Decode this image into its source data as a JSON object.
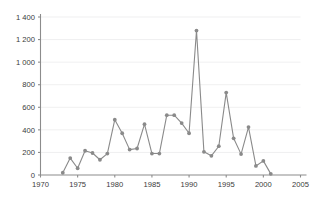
{
  "chart_data": {
    "type": "line",
    "title": "",
    "subtitle": "",
    "xlabel": "",
    "ylabel": "",
    "xlim": [
      1970,
      2005
    ],
    "ylim": [
      0,
      1400
    ],
    "grid": true,
    "legend": false,
    "legend_position": "none",
    "marker": "circle",
    "series_color": "#8a8a8a",
    "gridline_color": "#e8e8ea",
    "axis_color": "#8c8c8c",
    "x_tick_labels": [
      "1970",
      "1975",
      "1980",
      "1985",
      "1990",
      "1995",
      "2000",
      "2005"
    ],
    "x_ticks": [
      1970,
      1975,
      1980,
      1985,
      1990,
      1995,
      2000,
      2005
    ],
    "y_tick_labels": [
      "0",
      "200",
      "400",
      "600",
      "800",
      "1 000",
      "1 200",
      "1 400"
    ],
    "y_ticks": [
      0,
      200,
      400,
      600,
      800,
      1000,
      1200,
      1400
    ],
    "x": [
      1973,
      1974,
      1975,
      1976,
      1977,
      1978,
      1979,
      1980,
      1981,
      1982,
      1983,
      1984,
      1985,
      1986,
      1987,
      1988,
      1989,
      1990,
      1991,
      1992,
      1993,
      1994,
      1995,
      1996,
      1997,
      1998,
      1999,
      2000,
      2001
    ],
    "values": [
      20,
      150,
      60,
      215,
      195,
      135,
      190,
      490,
      370,
      225,
      235,
      450,
      190,
      190,
      530,
      530,
      460,
      370,
      1280,
      205,
      170,
      255,
      730,
      325,
      185,
      425,
      80,
      125,
      10
    ],
    "series": [
      {
        "name": "",
        "x": [
          1973,
          1974,
          1975,
          1976,
          1977,
          1978,
          1979,
          1980,
          1981,
          1982,
          1983,
          1984,
          1985,
          1986,
          1987,
          1988,
          1989,
          1990,
          1991,
          1992,
          1993,
          1994,
          1995,
          1996,
          1997,
          1998,
          1999,
          2000,
          2001
        ],
        "values": [
          20,
          150,
          60,
          215,
          195,
          135,
          190,
          490,
          370,
          225,
          235,
          450,
          190,
          190,
          530,
          530,
          460,
          370,
          1280,
          205,
          170,
          255,
          730,
          325,
          185,
          425,
          80,
          125,
          10
        ]
      }
    ]
  }
}
